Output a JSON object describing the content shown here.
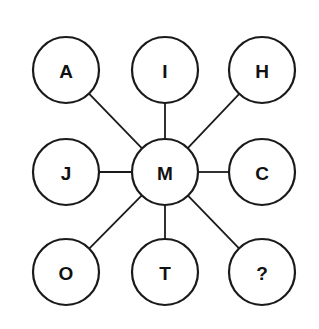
{
  "diagram": {
    "type": "letter-puzzle-hub",
    "center": {
      "label": "M",
      "x": 165,
      "y": 172
    },
    "nodes": [
      {
        "id": "top-left",
        "label": "A",
        "x": 66,
        "y": 70
      },
      {
        "id": "top-center",
        "label": "I",
        "x": 165,
        "y": 70
      },
      {
        "id": "top-right",
        "label": "H",
        "x": 262,
        "y": 70
      },
      {
        "id": "middle-left",
        "label": "J",
        "x": 66,
        "y": 172
      },
      {
        "id": "middle-right",
        "label": "C",
        "x": 262,
        "y": 172
      },
      {
        "id": "bottom-left",
        "label": "O",
        "x": 66,
        "y": 272
      },
      {
        "id": "bottom-center",
        "label": "T",
        "x": 165,
        "y": 272
      },
      {
        "id": "bottom-right",
        "label": "?",
        "x": 262,
        "y": 272
      }
    ],
    "radius": 33,
    "stroke_color": "#1a1a1a",
    "background": "#ffffff"
  }
}
